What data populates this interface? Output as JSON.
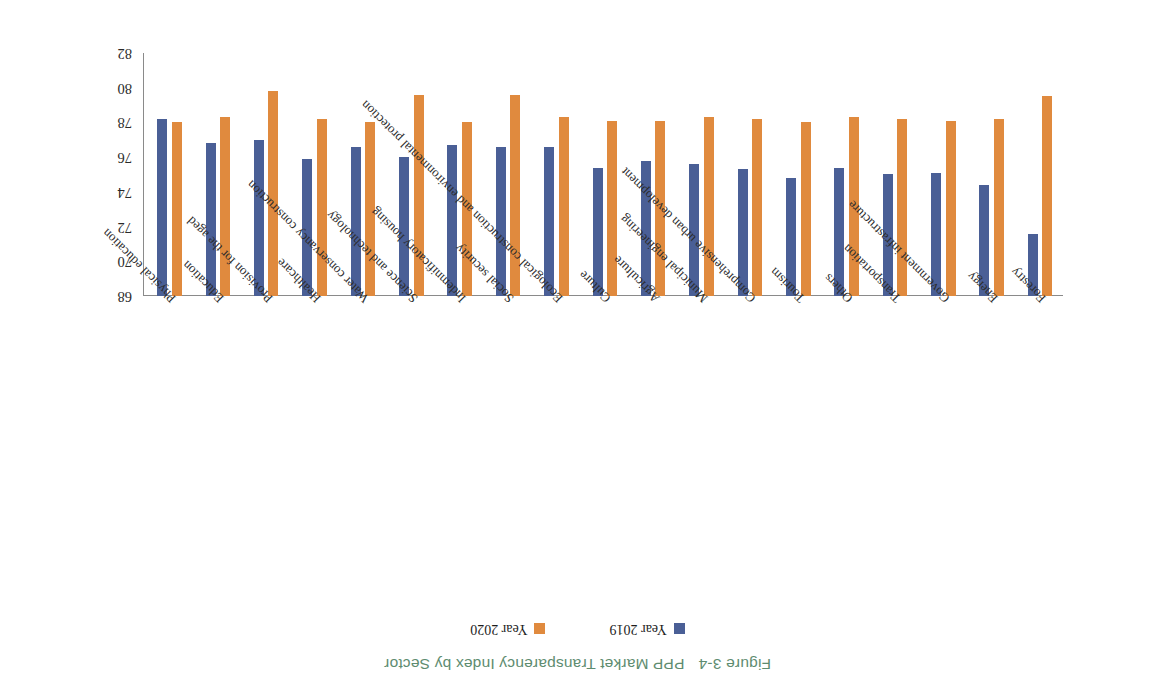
{
  "caption": {
    "figure_number": "Figure 3-4",
    "title": "PPP Market Transparency Index by Sector",
    "color": "#5e8c70"
  },
  "legend": {
    "position": "top",
    "items": [
      {
        "label": "Year 2019",
        "color": "#4a5f96",
        "icon": "legend-swatch-blue"
      },
      {
        "label": "Year 2020",
        "color": "#e08a3e",
        "icon": "legend-swatch-orange"
      }
    ]
  },
  "axis": {
    "y_ticks": [
      "68",
      "70",
      "72",
      "74",
      "76",
      "78",
      "80",
      "82"
    ]
  },
  "chart_data": {
    "type": "bar",
    "title": "PPP Market Transparency Index by Sector",
    "xlabel": "",
    "ylabel": "",
    "ylim": [
      68,
      82
    ],
    "grid": false,
    "legend_position": "top",
    "orientation": "vertical",
    "categories": [
      "Forestry",
      "Energy",
      "Government infrastructure",
      "Transportation",
      "Others",
      "Tourism",
      "Comprehensive urban development",
      "Municipal engineering",
      "Agriculture",
      "Culture",
      "Ecological construction and environmental protection",
      "Social security",
      "Indemnificatory housing",
      "Science and technology",
      "Water conservancy construction",
      "Healthcare",
      "Provision for the aged",
      "Education",
      "Physical education"
    ],
    "series": [
      {
        "name": "Year 2019",
        "color": "#4a5f96",
        "values": [
          71.6,
          74.4,
          75.1,
          75.0,
          75.4,
          74.8,
          75.3,
          75.6,
          75.8,
          75.4,
          76.6,
          76.6,
          76.7,
          76.0,
          76.6,
          75.9,
          77.0,
          76.8,
          78.2
        ]
      },
      {
        "name": "Year 2020",
        "color": "#e08a3e",
        "values": [
          79.5,
          78.2,
          78.1,
          78.2,
          78.3,
          78.0,
          78.2,
          78.3,
          78.1,
          78.1,
          78.3,
          79.6,
          78.0,
          79.6,
          78.0,
          78.2,
          79.8,
          78.3,
          78.0
        ]
      }
    ]
  }
}
